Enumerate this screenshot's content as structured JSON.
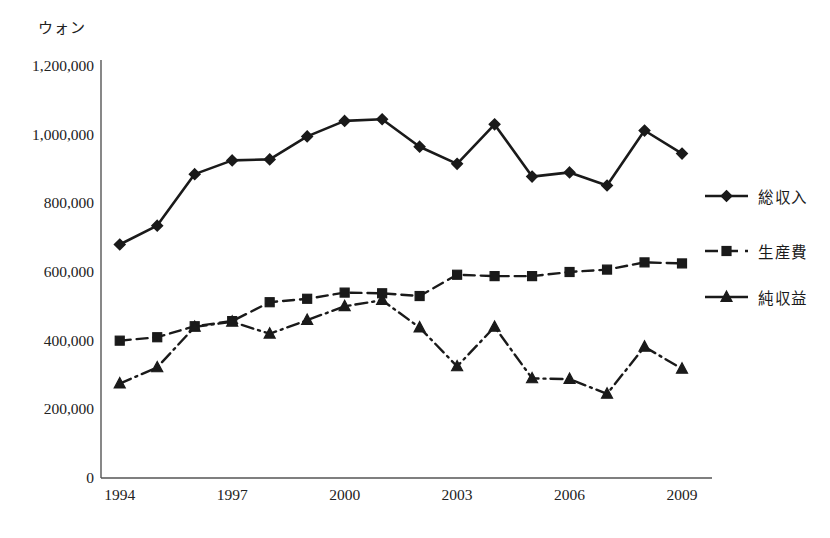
{
  "chart_data": {
    "type": "line",
    "title": "",
    "unit_label": "ウォン",
    "xlabel": "",
    "ylabel": "",
    "x": [
      1994,
      1995,
      1996,
      1997,
      1998,
      1999,
      2000,
      2001,
      2002,
      2003,
      2004,
      2005,
      2006,
      2007,
      2008,
      2009
    ],
    "x_tick_labels": [
      "1994",
      "1997",
      "2000",
      "2003",
      "2006",
      "2009"
    ],
    "x_tick_values": [
      1994,
      1997,
      2000,
      2003,
      2006,
      2009
    ],
    "y_tick_labels": [
      "0",
      "200,000",
      "400,000",
      "600,000",
      "800,000",
      "1,000,000",
      "1,200,000"
    ],
    "y_tick_values": [
      0,
      200000,
      400000,
      600000,
      800000,
      1000000,
      1200000
    ],
    "ylim": [
      0,
      1200000
    ],
    "xlim": [
      1993.5,
      2009.8
    ],
    "grid": false,
    "legend_position": "right",
    "series": [
      {
        "name": "総収入",
        "marker": "diamond",
        "line_style": "solid",
        "color": "#1a1a1a",
        "values": [
          680000,
          735000,
          885000,
          925000,
          928000,
          995000,
          1040000,
          1045000,
          965000,
          915000,
          1030000,
          878000,
          890000,
          852000,
          1012000,
          945000
        ]
      },
      {
        "name": "生産費",
        "marker": "square",
        "line_style": "dashed",
        "color": "#1a1a1a",
        "values": [
          400000,
          410000,
          442000,
          457000,
          512000,
          522000,
          540000,
          538000,
          530000,
          592000,
          588000,
          588000,
          600000,
          607000,
          628000,
          625000
        ]
      },
      {
        "name": "純収益",
        "marker": "triangle",
        "line_style": "dashdot",
        "color": "#1a1a1a",
        "values": [
          275000,
          322000,
          440000,
          455000,
          420000,
          460000,
          500000,
          518000,
          438000,
          325000,
          440000,
          290000,
          288000,
          245000,
          382000,
          318000
        ]
      }
    ]
  },
  "legend": {
    "items": [
      {
        "label": "総収入"
      },
      {
        "label": "生産費"
      },
      {
        "label": "純収益"
      }
    ]
  }
}
